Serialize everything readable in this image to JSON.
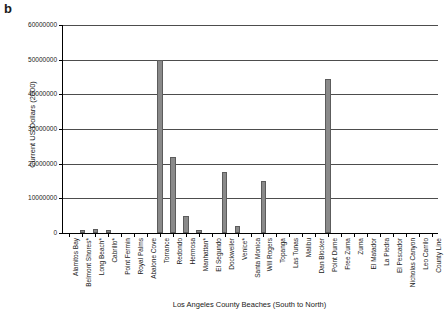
{
  "panel": {
    "label": "b"
  },
  "chart_data": {
    "type": "bar",
    "title": "",
    "xlabel": "Los Angeles County Beaches (South to North)",
    "ylabel": "Current US Dollars (2000)",
    "ylim": [
      0,
      60000000
    ],
    "ytick_values": [
      0,
      10000000,
      20000000,
      30000000,
      40000000,
      50000000,
      60000000
    ],
    "ytick_labels": [
      "0",
      "10000000",
      "20000000",
      "30000000",
      "40000000",
      "50000000",
      "60000000"
    ],
    "grid": true,
    "legend": "none",
    "bar_color": "#8a8a8a",
    "bar_edge_color": "#5c5c5c",
    "categories": [
      "Alamitos Bay",
      "Belmont Shores*",
      "Long Beach*",
      "Cabrillo*",
      "Point Fermin",
      "Royal Palms",
      "Abalone Cove",
      "Torrance",
      "Redondo",
      "Hermosa",
      "Manhattan*",
      "El Segundo",
      "Dockweiler",
      "Venice*",
      "Santa Monica",
      "Will Rogers",
      "Topanga",
      "Las Tunas",
      "Malibu",
      "Dan Blocker",
      "Point Dume",
      "Free Zuma",
      "Zuma",
      "El Matador",
      "La Piedra",
      "El Pescador",
      "Nicholas Canyon",
      "Leo Carrilo",
      "County Line"
    ],
    "values": [
      0,
      900000,
      1100000,
      900000,
      0,
      0,
      0,
      50000000,
      22000000,
      5000000,
      1000000,
      0,
      17500000,
      2000000,
      0,
      15000000,
      0,
      0,
      0,
      0,
      44500000,
      0,
      0,
      0,
      0,
      0,
      0,
      0,
      0
    ]
  }
}
